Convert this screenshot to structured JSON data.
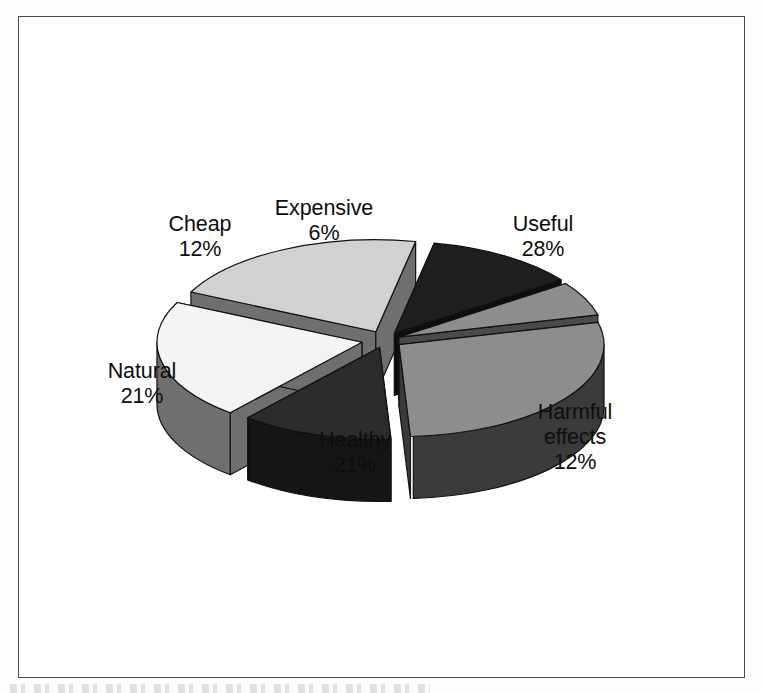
{
  "figure": {
    "background_color": "#ffffff",
    "frame_color": "#4a4a4a",
    "label_text_color": "#0d0d0d"
  },
  "chart_data": {
    "type": "pie",
    "title": "",
    "subtitle": "",
    "xlabel": "",
    "ylabel": "",
    "style": "exploded 3D pie chart, greyscale scan",
    "legend_position": "none",
    "grid": false,
    "labels_show_name_and_percent": true,
    "categories": [
      "Useful",
      "Harmful effects",
      "Healthy",
      "Natural",
      "Cheap",
      "Expensive"
    ],
    "values": [
      28,
      12,
      21,
      21,
      12,
      6
    ],
    "units": "%",
    "total": 100,
    "slices": [
      {
        "name": "Useful",
        "label": "Useful",
        "percent": 28,
        "percent_text": "28%",
        "top_color": "#8d8d8d",
        "side_color": "#3a3a3a",
        "start_angle": -14,
        "end_angle": 86.8,
        "explode": 0.085
      },
      {
        "name": "Harmful effects",
        "label_line1": "Harmful",
        "label_line2": "effects",
        "percent": 12,
        "percent_text": "12%",
        "top_color": "#2b2b2b",
        "side_color": "#151515",
        "start_angle": 86.8,
        "end_angle": 130,
        "explode": 0.085
      },
      {
        "name": "Healthy",
        "label": "Healthy",
        "percent": 21,
        "percent_text": "21%",
        "top_color": "#f4f4f4",
        "side_color": "#6f6f6f",
        "start_angle": 130,
        "end_angle": 205.6,
        "explode": 0.115
      },
      {
        "name": "Natural",
        "label": "Natural",
        "percent": 21,
        "percent_text": "21%",
        "top_color": "#d2d2d2",
        "side_color": "#6f6f6f",
        "start_angle": 205.6,
        "end_angle": 281.2,
        "explode": 0.1
      },
      {
        "name": "Cheap",
        "label": "Cheap",
        "percent": 12,
        "percent_text": "12%",
        "top_color": "#1e1e1e",
        "side_color": "#0d0d0d",
        "start_angle": 281.2,
        "end_angle": 324.4,
        "explode": 0.085
      },
      {
        "name": "Expensive",
        "label": "Expensive",
        "percent": 6,
        "percent_text": "6%",
        "top_color": "#8d8d8d",
        "side_color": "#4a4a4a",
        "start_angle": 324.4,
        "end_angle": 346,
        "explode": 0.075
      }
    ]
  },
  "labels": {
    "cheap": {
      "name": "Cheap",
      "pct": "12%"
    },
    "expensive": {
      "name": "Expensive",
      "pct": "6%"
    },
    "useful": {
      "name": "Useful",
      "pct": "28%"
    },
    "natural": {
      "name": "Natural",
      "pct": "21%"
    },
    "healthy": {
      "name": "Healthy",
      "pct": "21%"
    },
    "harmful": {
      "name1": "Harmful",
      "name2": "effects",
      "pct": "12%"
    }
  }
}
